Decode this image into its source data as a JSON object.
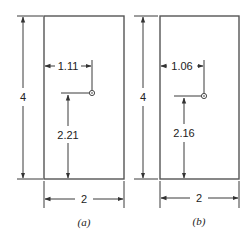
{
  "figure": {
    "panels": [
      {
        "id": "a",
        "caption": "(a)",
        "height_label": "4",
        "width_label": "2",
        "centroid_x_label": "1.11",
        "centroid_y_label": "2.21"
      },
      {
        "id": "b",
        "caption": "(b)",
        "height_label": "4",
        "width_label": "2",
        "centroid_x_label": "1.06",
        "centroid_y_label": "2.16"
      }
    ],
    "colors": {
      "line": "#3a3a3a",
      "outline": "#555555",
      "text": "#222222",
      "background": "#ffffff"
    }
  }
}
